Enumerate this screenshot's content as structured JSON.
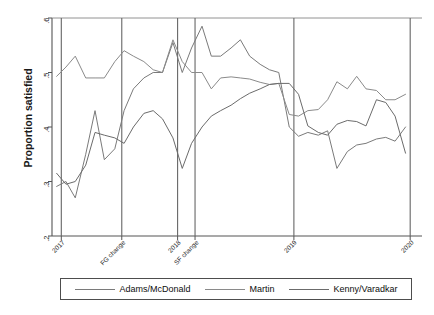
{
  "chart_data": {
    "type": "line",
    "title": "",
    "xlabel": "",
    "ylabel": "Proportion satisfied",
    "ylim": [
      0.2,
      0.6
    ],
    "xlim": [
      2016.92,
      2020.05
    ],
    "grid": false,
    "legend_position": "bottom",
    "y_ticks": [
      {
        "value": 0.6,
        "label": ".6"
      },
      {
        "value": 0.5,
        "label": ".5"
      },
      {
        "value": 0.4,
        "label": ".4"
      },
      {
        "value": 0.3,
        "label": ".3"
      },
      {
        "value": 0.2,
        "label": ".2"
      }
    ],
    "x_ticks": [
      {
        "value": 2017.0,
        "label": "2017"
      },
      {
        "value": 2017.52,
        "label": "FG change"
      },
      {
        "value": 2018.0,
        "label": "2018"
      },
      {
        "value": 2018.15,
        "label": "SF change"
      },
      {
        "value": 2019.0,
        "label": "2019"
      },
      {
        "value": 2020.0,
        "label": "2020"
      }
    ],
    "reference_lines": [
      {
        "x": 2017.0,
        "label": "2017"
      },
      {
        "x": 2017.52,
        "label": "FG change"
      },
      {
        "x": 2018.0,
        "label": "2018"
      },
      {
        "x": 2018.15,
        "label": "SF change"
      },
      {
        "x": 2019.0,
        "label": "2019"
      },
      {
        "x": 2020.0,
        "label": "2020"
      }
    ],
    "series": [
      {
        "name": "Adams/McDonald",
        "color": "#7a7a7a",
        "x": [
          2016.96,
          2017.04,
          2017.12,
          2017.21,
          2017.29,
          2017.37,
          2017.46,
          2017.54,
          2017.62,
          2017.71,
          2017.79,
          2017.87,
          2017.96,
          2018.04,
          2018.12,
          2018.21,
          2018.29,
          2018.37,
          2018.46,
          2018.54,
          2018.62,
          2018.71,
          2018.79,
          2018.87,
          2018.96,
          2019.04,
          2019.12,
          2019.21,
          2019.29,
          2019.37,
          2019.46,
          2019.54,
          2019.62,
          2019.71,
          2019.79,
          2019.87,
          2019.96
        ],
        "y": [
          0.291,
          0.3,
          0.27,
          0.35,
          0.43,
          0.34,
          0.36,
          0.43,
          0.47,
          0.49,
          0.5,
          0.5,
          0.555,
          0.5,
          0.545,
          0.585,
          0.53,
          0.53,
          0.545,
          0.56,
          0.53,
          0.515,
          0.505,
          0.5,
          0.4,
          0.383,
          0.39,
          0.385,
          0.393,
          0.324,
          0.355,
          0.367,
          0.37,
          0.378,
          0.381,
          0.374,
          0.4
        ]
      },
      {
        "name": "Martin",
        "color": "#8a8a8a",
        "x": [
          2016.96,
          2017.04,
          2017.12,
          2017.21,
          2017.29,
          2017.37,
          2017.46,
          2017.54,
          2017.62,
          2017.71,
          2017.79,
          2017.87,
          2017.96,
          2018.04,
          2018.12,
          2018.21,
          2018.29,
          2018.37,
          2018.46,
          2018.54,
          2018.62,
          2018.71,
          2018.79,
          2018.87,
          2018.96,
          2019.04,
          2019.12,
          2019.21,
          2019.29,
          2019.37,
          2019.46,
          2019.54,
          2019.62,
          2019.71,
          2019.79,
          2019.87,
          2019.96
        ],
        "y": [
          0.493,
          0.51,
          0.53,
          0.49,
          0.49,
          0.49,
          0.52,
          0.54,
          0.53,
          0.52,
          0.505,
          0.5,
          0.56,
          0.52,
          0.5,
          0.5,
          0.47,
          0.49,
          0.492,
          0.49,
          0.488,
          0.482,
          0.478,
          0.48,
          0.423,
          0.42,
          0.43,
          0.432,
          0.45,
          0.483,
          0.47,
          0.493,
          0.47,
          0.467,
          0.45,
          0.45,
          0.46
        ]
      },
      {
        "name": "Kenny/Varadkar",
        "color": "#6b6b6b",
        "x": [
          2016.96,
          2017.04,
          2017.12,
          2017.21,
          2017.29,
          2017.37,
          2017.46,
          2017.54,
          2017.62,
          2017.71,
          2017.79,
          2017.87,
          2017.96,
          2018.04,
          2018.12,
          2018.21,
          2018.29,
          2018.37,
          2018.46,
          2018.54,
          2018.62,
          2018.71,
          2018.79,
          2018.87,
          2018.96,
          2019.04,
          2019.12,
          2019.21,
          2019.29,
          2019.37,
          2019.46,
          2019.54,
          2019.62,
          2019.71,
          2019.79,
          2019.87,
          2019.96
        ],
        "y": [
          0.315,
          0.295,
          0.3,
          0.33,
          0.39,
          0.385,
          0.38,
          0.37,
          0.4,
          0.425,
          0.43,
          0.415,
          0.38,
          0.324,
          0.37,
          0.4,
          0.42,
          0.43,
          0.44,
          0.452,
          0.462,
          0.47,
          0.478,
          0.48,
          0.48,
          0.46,
          0.402,
          0.39,
          0.385,
          0.405,
          0.412,
          0.41,
          0.402,
          0.45,
          0.445,
          0.42,
          0.352
        ]
      }
    ]
  },
  "axis": {
    "y_title": "Proportion satisfied"
  },
  "legend": {
    "entries": [
      {
        "label": "Adams/McDonald",
        "color": "#7a7a7a"
      },
      {
        "label": "Martin",
        "color": "#8a8a8a"
      },
      {
        "label": "Kenny/Varadkar",
        "color": "#6b6b6b"
      }
    ]
  }
}
